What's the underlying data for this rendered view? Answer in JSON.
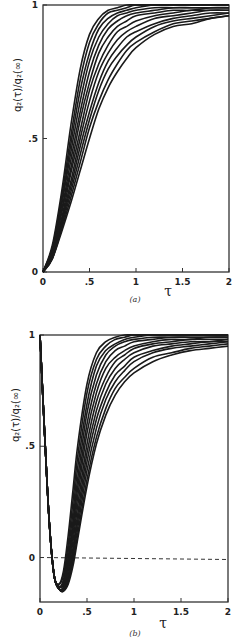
{
  "chart_data": [
    {
      "panel": "a",
      "type": "line",
      "caption": "(a)",
      "xlabel": "τ",
      "ylabel": "q₂(τ)/q₂(∞)",
      "xlim": [
        0,
        2
      ],
      "ylim": [
        0,
        1
      ],
      "xticks": [
        0,
        0.5,
        1,
        1.5,
        2
      ],
      "xtick_labels": [
        "0",
        ".5",
        "1",
        "1.5",
        "2"
      ],
      "yticks": [
        0,
        0.5,
        1
      ],
      "ytick_labels": [
        "0",
        ".5",
        "1"
      ],
      "grid": false,
      "legend": null,
      "series_count": 12,
      "x": [
        0,
        0.1,
        0.2,
        0.3,
        0.4,
        0.5,
        0.6,
        0.7,
        0.8,
        0.9,
        1.0,
        1.2,
        1.4,
        1.6,
        1.8,
        2.0
      ],
      "series": [
        {
          "name": "curve 1",
          "values": [
            0,
            0.1,
            0.3,
            0.55,
            0.76,
            0.89,
            0.95,
            0.98,
            0.99,
            1.0,
            1.0,
            1.0,
            1.0,
            1.0,
            1.0,
            1.0
          ]
        },
        {
          "name": "curve 2",
          "values": [
            0,
            0.09,
            0.28,
            0.51,
            0.72,
            0.86,
            0.93,
            0.97,
            0.98,
            0.99,
            1.0,
            1.0,
            1.0,
            1.0,
            1.0,
            1.0
          ]
        },
        {
          "name": "curve 3",
          "values": [
            0,
            0.09,
            0.26,
            0.48,
            0.68,
            0.82,
            0.91,
            0.95,
            0.97,
            0.98,
            0.99,
            1.0,
            1.0,
            1.0,
            1.0,
            1.0
          ]
        },
        {
          "name": "curve 4",
          "values": [
            0,
            0.08,
            0.25,
            0.45,
            0.64,
            0.79,
            0.88,
            0.93,
            0.96,
            0.97,
            0.98,
            0.99,
            0.99,
            0.99,
            0.99,
            0.99
          ]
        },
        {
          "name": "curve 5",
          "values": [
            0,
            0.08,
            0.23,
            0.42,
            0.6,
            0.75,
            0.85,
            0.91,
            0.94,
            0.96,
            0.97,
            0.98,
            0.99,
            0.99,
            0.99,
            0.99
          ]
        },
        {
          "name": "curve 6",
          "values": [
            0,
            0.07,
            0.22,
            0.39,
            0.57,
            0.71,
            0.82,
            0.88,
            0.92,
            0.94,
            0.96,
            0.97,
            0.98,
            0.98,
            0.99,
            0.99
          ]
        },
        {
          "name": "curve 7",
          "values": [
            0,
            0.07,
            0.2,
            0.37,
            0.53,
            0.68,
            0.78,
            0.85,
            0.9,
            0.92,
            0.94,
            0.96,
            0.97,
            0.98,
            0.98,
            0.98
          ]
        },
        {
          "name": "curve 8",
          "values": [
            0,
            0.06,
            0.19,
            0.34,
            0.5,
            0.64,
            0.75,
            0.82,
            0.87,
            0.9,
            0.92,
            0.95,
            0.96,
            0.97,
            0.98,
            0.98
          ]
        },
        {
          "name": "curve 9",
          "values": [
            0,
            0.06,
            0.18,
            0.32,
            0.47,
            0.6,
            0.71,
            0.79,
            0.84,
            0.88,
            0.9,
            0.93,
            0.95,
            0.96,
            0.97,
            0.97
          ]
        },
        {
          "name": "curve 10",
          "values": [
            0,
            0.05,
            0.17,
            0.3,
            0.44,
            0.57,
            0.68,
            0.76,
            0.81,
            0.85,
            0.88,
            0.92,
            0.94,
            0.95,
            0.96,
            0.97
          ]
        },
        {
          "name": "curve 11",
          "values": [
            0,
            0.05,
            0.16,
            0.28,
            0.41,
            0.54,
            0.64,
            0.72,
            0.78,
            0.83,
            0.86,
            0.9,
            0.93,
            0.94,
            0.95,
            0.96
          ]
        },
        {
          "name": "curve 12",
          "values": [
            0,
            0.05,
            0.15,
            0.26,
            0.38,
            0.5,
            0.61,
            0.69,
            0.75,
            0.8,
            0.84,
            0.89,
            0.92,
            0.93,
            0.95,
            0.96
          ]
        }
      ]
    },
    {
      "panel": "b",
      "type": "line",
      "caption": "(b)",
      "xlabel": "τ",
      "ylabel": "q₂(τ)/q₂(∞)",
      "xlim": [
        0,
        2
      ],
      "ylim": [
        -0.2,
        1
      ],
      "xticks": [
        0,
        0.5,
        1,
        1.5,
        2
      ],
      "xtick_labels": [
        "0",
        ".5",
        "1",
        "1.5",
        "2"
      ],
      "yticks": [
        0,
        0.5,
        1
      ],
      "ytick_labels": [
        "0",
        ".5",
        "1"
      ],
      "grid": false,
      "legend": null,
      "reference_line": {
        "y": 0,
        "style": "dashed"
      },
      "series_count": 12,
      "x": [
        0,
        0.05,
        0.1,
        0.15,
        0.2,
        0.25,
        0.3,
        0.35,
        0.4,
        0.5,
        0.6,
        0.7,
        0.8,
        0.9,
        1.0,
        1.2,
        1.4,
        1.6,
        1.8,
        2.0
      ],
      "series": [
        {
          "name": "curve 1",
          "values": [
            1,
            0.55,
            0.15,
            -0.08,
            -0.12,
            -0.06,
            0.1,
            0.3,
            0.5,
            0.78,
            0.92,
            0.97,
            0.99,
            1.0,
            1.0,
            1.0,
            1.0,
            1.0,
            1.0,
            1.0
          ]
        },
        {
          "name": "curve 2",
          "values": [
            1,
            0.55,
            0.15,
            -0.08,
            -0.12,
            -0.08,
            0.06,
            0.25,
            0.45,
            0.74,
            0.89,
            0.95,
            0.98,
            0.99,
            1.0,
            1.0,
            1.0,
            1.0,
            1.0,
            1.0
          ]
        },
        {
          "name": "curve 3",
          "values": [
            1,
            0.55,
            0.15,
            -0.08,
            -0.13,
            -0.1,
            0.03,
            0.2,
            0.4,
            0.69,
            0.86,
            0.93,
            0.96,
            0.98,
            0.99,
            1.0,
            1.0,
            1.0,
            1.0,
            1.0
          ]
        },
        {
          "name": "curve 4",
          "values": [
            1,
            0.55,
            0.15,
            -0.08,
            -0.13,
            -0.11,
            0.0,
            0.16,
            0.35,
            0.65,
            0.82,
            0.91,
            0.95,
            0.97,
            0.98,
            0.99,
            0.99,
            0.99,
            0.99,
            0.99
          ]
        },
        {
          "name": "curve 5",
          "values": [
            1,
            0.55,
            0.15,
            -0.08,
            -0.13,
            -0.12,
            -0.02,
            0.13,
            0.31,
            0.6,
            0.78,
            0.88,
            0.93,
            0.95,
            0.97,
            0.98,
            0.99,
            0.99,
            0.99,
            0.99
          ]
        },
        {
          "name": "curve 6",
          "values": [
            1,
            0.55,
            0.15,
            -0.08,
            -0.14,
            -0.13,
            -0.04,
            0.1,
            0.27,
            0.56,
            0.74,
            0.85,
            0.9,
            0.93,
            0.95,
            0.97,
            0.98,
            0.98,
            0.99,
            0.99
          ]
        },
        {
          "name": "curve 7",
          "values": [
            1,
            0.55,
            0.15,
            -0.08,
            -0.14,
            -0.14,
            -0.06,
            0.07,
            0.23,
            0.51,
            0.7,
            0.81,
            0.88,
            0.91,
            0.94,
            0.96,
            0.97,
            0.98,
            0.98,
            0.98
          ]
        },
        {
          "name": "curve 8",
          "values": [
            1,
            0.55,
            0.15,
            -0.08,
            -0.14,
            -0.14,
            -0.08,
            0.04,
            0.19,
            0.47,
            0.66,
            0.78,
            0.85,
            0.89,
            0.92,
            0.95,
            0.96,
            0.97,
            0.97,
            0.98
          ]
        },
        {
          "name": "curve 9",
          "values": [
            1,
            0.55,
            0.15,
            -0.08,
            -0.14,
            -0.15,
            -0.09,
            0.02,
            0.16,
            0.43,
            0.62,
            0.74,
            0.82,
            0.86,
            0.9,
            0.93,
            0.95,
            0.96,
            0.97,
            0.97
          ]
        },
        {
          "name": "curve 10",
          "values": [
            1,
            0.55,
            0.15,
            -0.08,
            -0.14,
            -0.15,
            -0.1,
            0.0,
            0.13,
            0.39,
            0.58,
            0.71,
            0.79,
            0.84,
            0.88,
            0.92,
            0.94,
            0.95,
            0.96,
            0.97
          ]
        },
        {
          "name": "curve 11",
          "values": [
            1,
            0.55,
            0.15,
            -0.08,
            -0.14,
            -0.15,
            -0.11,
            -0.02,
            0.1,
            0.35,
            0.54,
            0.67,
            0.76,
            0.81,
            0.85,
            0.9,
            0.92,
            0.94,
            0.95,
            0.96
          ]
        },
        {
          "name": "curve 12",
          "values": [
            1,
            0.55,
            0.15,
            -0.08,
            -0.14,
            -0.15,
            -0.12,
            -0.04,
            0.08,
            0.32,
            0.51,
            0.64,
            0.73,
            0.79,
            0.83,
            0.88,
            0.91,
            0.93,
            0.94,
            0.95
          ]
        }
      ]
    }
  ],
  "panels": {
    "a": {
      "caption": "(a)",
      "xlabel": "τ",
      "ylabel": "q₂(τ)/q₂(∞)"
    },
    "b": {
      "caption": "(b)",
      "xlabel": "τ",
      "ylabel": "q₂(τ)/q₂(∞)"
    }
  },
  "style": {
    "line_color": "#1a1a1a",
    "axis_color": "#333333",
    "background": "#ffffff"
  }
}
